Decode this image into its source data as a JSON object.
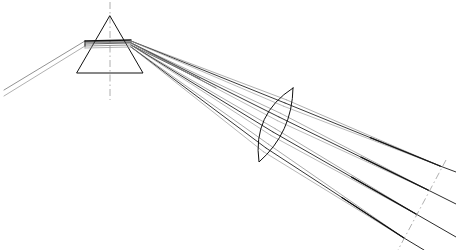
{
  "diagram": {
    "background_color": "#ffffff",
    "ink_color": "#111111",
    "axis_color": "#9a9a9a",
    "width": 456,
    "height": 250
  },
  "prism": {
    "name": "dispersing-prism",
    "apex": {
      "x": 110,
      "y": 16
    },
    "base_left": {
      "x": 77,
      "y": 73
    },
    "base_right": {
      "x": 143,
      "y": 73
    },
    "axis": {
      "x": 110,
      "y_top": 2,
      "y_bottom": 100
    },
    "entry_point": {
      "x": 85,
      "y": 41
    },
    "exit_point": {
      "x": 131,
      "y": 44
    },
    "stroke_width": 1.1
  },
  "lens": {
    "name": "biconvex-lens",
    "top": {
      "x": 293,
      "y": 88
    },
    "bottom": {
      "x": 259,
      "y": 162
    },
    "tilt_degrees": 24,
    "front_bulge": 13,
    "back_bulge": 9,
    "stroke_width": 1.1
  },
  "image_plane": {
    "name": "image-plane-axis",
    "start": {
      "x": 446,
      "y": 160
    },
    "end": {
      "x": 398,
      "y": 250
    },
    "dash_pattern": "7 3 1.5 3"
  },
  "incoming_beam": {
    "label": "collimated-input-beam",
    "origin_x": 4,
    "rays": [
      {
        "from": {
          "x": 4,
          "y": 90
        },
        "to": {
          "x": 85,
          "y": 41
        },
        "shade": "#6d6d6d",
        "width": 0.75
      },
      {
        "from": {
          "x": 4,
          "y": 96
        },
        "to": {
          "x": 85,
          "y": 46
        },
        "shade": "#8e8e8e",
        "width": 0.7
      }
    ]
  },
  "internal_rays": [
    {
      "from": {
        "x": 85,
        "y": 41
      },
      "to": {
        "x": 131,
        "y": 40
      },
      "shade": "#111111",
      "width": 1.4
    },
    {
      "from": {
        "x": 85,
        "y": 42
      },
      "to": {
        "x": 131,
        "y": 42
      },
      "shade": "#2c2c2c",
      "width": 1.1
    },
    {
      "from": {
        "x": 85,
        "y": 44
      },
      "to": {
        "x": 131,
        "y": 43
      },
      "shade": "#585858",
      "width": 0.9
    },
    {
      "from": {
        "x": 85,
        "y": 46
      },
      "to": {
        "x": 131,
        "y": 45
      },
      "shade": "#7d7d7d",
      "width": 0.8
    },
    {
      "from": {
        "x": 85,
        "y": 48
      },
      "to": {
        "x": 131,
        "y": 47
      },
      "shade": "#9c9c9c",
      "width": 0.75
    }
  ],
  "spectral_bundles": [
    {
      "name": "bundle-1",
      "exit": {
        "x": 131,
        "y": 41
      },
      "lens_hit": {
        "x": 285,
        "y": 103
      },
      "focus": {
        "x": 440,
        "y": 166
      },
      "tail": {
        "x": 456,
        "y": 172
      },
      "shade_upper": "#8d8d8d",
      "shade_lower": "#9e9e9e",
      "shade_core": "#161616",
      "spread": 7
    },
    {
      "name": "bundle-2",
      "exit": {
        "x": 131,
        "y": 43
      },
      "lens_hit": {
        "x": 279,
        "y": 117
      },
      "focus": {
        "x": 428,
        "y": 190
      },
      "tail": {
        "x": 456,
        "y": 204
      },
      "shade_upper": "#8a8a8a",
      "shade_lower": "#9c9c9c",
      "shade_core": "#141414",
      "spread": 8
    },
    {
      "name": "bundle-3",
      "exit": {
        "x": 131,
        "y": 45
      },
      "lens_hit": {
        "x": 273,
        "y": 132
      },
      "focus": {
        "x": 416,
        "y": 214
      },
      "tail": {
        "x": 456,
        "y": 237
      },
      "shade_upper": "#878787",
      "shade_lower": "#9a9a9a",
      "shade_core": "#121212",
      "spread": 8
    },
    {
      "name": "bundle-4",
      "exit": {
        "x": 131,
        "y": 47
      },
      "lens_hit": {
        "x": 266,
        "y": 148
      },
      "focus": {
        "x": 404,
        "y": 238
      },
      "tail": {
        "x": 424,
        "y": 250
      },
      "shade_upper": "#848484",
      "shade_lower": "#979797",
      "shade_core": "#101010",
      "spread": 9
    }
  ],
  "stray_rays": [
    {
      "from": {
        "x": 133,
        "y": 44
      },
      "to": {
        "x": 216,
        "y": 88
      },
      "shade": "#2e2e2e",
      "width": 0.85
    },
    {
      "from": {
        "x": 133,
        "y": 46
      },
      "to": {
        "x": 200,
        "y": 79
      },
      "shade": "#464646",
      "width": 0.8
    }
  ]
}
